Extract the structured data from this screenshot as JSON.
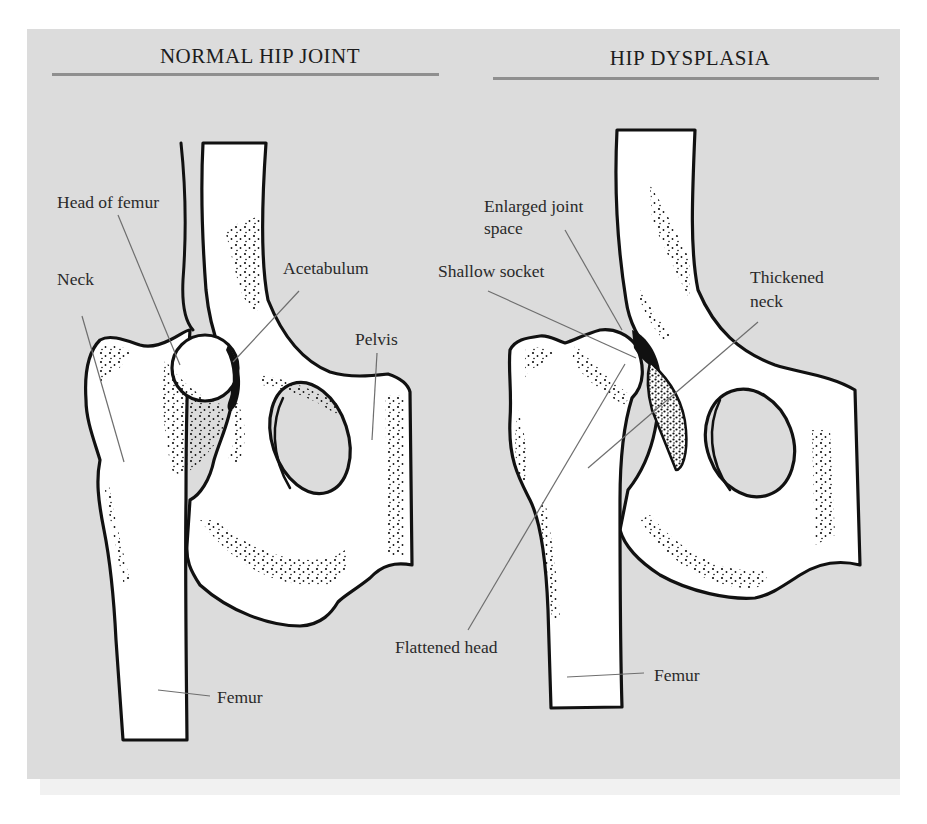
{
  "figure": {
    "background_color": "#dcdcdc",
    "rule_color": "#8f8f8f",
    "bone_fill": "#ffffff",
    "outline_color": "#111111",
    "leader_color": "#6e6e6e"
  },
  "panels": [
    {
      "id": "normal",
      "title": "NORMAL HIP JOINT",
      "labels": [
        {
          "key": "head_of_femur",
          "text": "Head of femur"
        },
        {
          "key": "neck",
          "text": "Neck"
        },
        {
          "key": "acetabulum",
          "text": "Acetabulum"
        },
        {
          "key": "pelvis",
          "text": "Pelvis"
        },
        {
          "key": "femur",
          "text": "Femur"
        }
      ]
    },
    {
      "id": "dysplasia",
      "title": "HIP DYSPLASIA",
      "labels": [
        {
          "key": "enlarged_joint_space_line1",
          "text": "Enlarged joint"
        },
        {
          "key": "enlarged_joint_space_line2",
          "text": "space"
        },
        {
          "key": "shallow_socket",
          "text": "Shallow socket"
        },
        {
          "key": "thickened_neck_line1",
          "text": "Thickened"
        },
        {
          "key": "thickened_neck_line2",
          "text": "neck"
        },
        {
          "key": "flattened_head",
          "text": "Flattened head"
        },
        {
          "key": "femur",
          "text": "Femur"
        }
      ]
    }
  ]
}
